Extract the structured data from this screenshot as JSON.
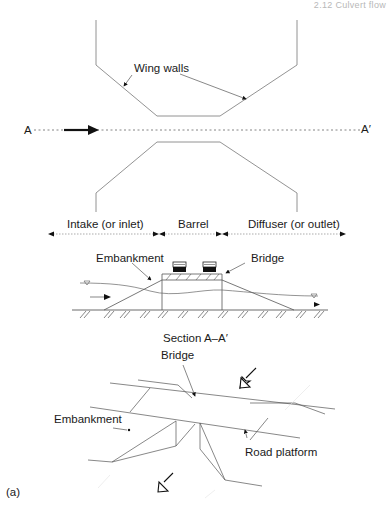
{
  "header": {
    "running_title": "2.12 Culvert flow"
  },
  "plan_view": {
    "wing_walls_label": "Wing walls",
    "section_start": "A",
    "section_end": "A′",
    "zones": [
      {
        "label": "Intake (or inlet)"
      },
      {
        "label": "Barrel"
      },
      {
        "label": "Diffuser (or outlet)"
      }
    ]
  },
  "section_view": {
    "embankment_label": "Embankment",
    "bridge_label": "Bridge",
    "caption": "Section A–A′",
    "water_surface_symbol": "▽",
    "flow_arrow": "arrow-right-icon"
  },
  "perspective_view": {
    "bridge_label": "Bridge",
    "embankment_label": "Embankment",
    "road_platform_label": "Road platform",
    "flow_arrows": [
      "hollow-arrow-down-left-icon",
      "hollow-arrow-down-left-icon"
    ]
  },
  "figure_label": "(a)",
  "colors": {
    "line": "#555555",
    "text": "#1a1a1a",
    "header": "#b8b8b8"
  }
}
